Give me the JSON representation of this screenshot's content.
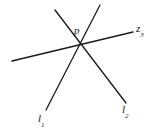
{
  "figure": {
    "name": "three-concurrent-lines-diagram",
    "width": 157,
    "height": 134,
    "background_color": "#ffffff",
    "line_color": "#1a1a1a",
    "line_width": 1.3
  },
  "labels": {
    "point": {
      "text": "p",
      "x": 74,
      "y": 25
    },
    "line3": {
      "base": "z",
      "subscript": "3",
      "x": 136,
      "y": 23
    },
    "line1": {
      "base": "l",
      "subscript": "1",
      "x": 38,
      "y": 113
    },
    "line2": {
      "base": "l",
      "subscript": "2",
      "x": 122,
      "y": 104
    }
  },
  "chart_data": {
    "type": "line",
    "title": "",
    "xlabel": "",
    "ylabel": "",
    "xlim": [
      0,
      157
    ],
    "ylim": [
      0,
      134
    ],
    "grid": false,
    "legend": "none",
    "intersection_point": {
      "label": "p",
      "x": 80,
      "y": 44
    },
    "series": [
      {
        "name": "l1",
        "label": "l₁",
        "x": [
          100,
          46
        ],
        "y": [
          5,
          110
        ],
        "from": [
          100,
          5
        ],
        "to": [
          46,
          110
        ]
      },
      {
        "name": "l2",
        "label": "l₂",
        "x": [
          55,
          126
        ],
        "y": [
          10,
          103
        ],
        "from": [
          55,
          10
        ],
        "to": [
          126,
          103
        ]
      },
      {
        "name": "z3",
        "label": "z₃",
        "x": [
          12,
          133
        ],
        "y": [
          61,
          32
        ],
        "from": [
          12,
          61
        ],
        "to": [
          133,
          32
        ]
      }
    ],
    "annotations": [
      {
        "text": "p",
        "x": 74,
        "y": 25
      },
      {
        "text": "z3",
        "x": 136,
        "y": 23
      },
      {
        "text": "l1",
        "x": 38,
        "y": 113
      },
      {
        "text": "l2",
        "x": 122,
        "y": 104
      }
    ]
  }
}
